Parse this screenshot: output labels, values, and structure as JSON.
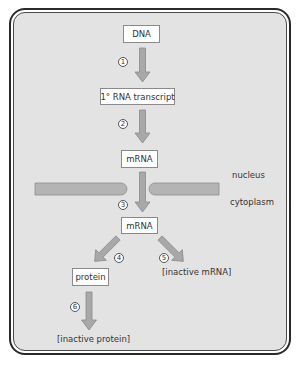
{
  "diagram": {
    "title": "",
    "nodes": {
      "dna": "DNA",
      "primary_transcript": "1° RNA transcript",
      "mrna_nucleus": "mRNA",
      "mrna_cytoplasm": "mRNA",
      "protein": "protein",
      "inactive_mrna": "[inactive mRNA]",
      "inactive_protein": "[inactive protein]"
    },
    "compartments": {
      "nucleus": "nucleus",
      "cytoplasm": "cytoplasm"
    },
    "steps": [
      "1",
      "2",
      "3",
      "4",
      "5",
      "6"
    ],
    "edges": [
      {
        "from": "DNA",
        "to": "1° RNA transcript",
        "step": "1"
      },
      {
        "from": "1° RNA transcript",
        "to": "mRNA",
        "step": "2"
      },
      {
        "from": "mRNA",
        "to": "mRNA (cytoplasm)",
        "step": "3"
      },
      {
        "from": "mRNA (cytoplasm)",
        "to": "protein",
        "step": "4"
      },
      {
        "from": "mRNA (cytoplasm)",
        "to": "[inactive mRNA]",
        "step": "5"
      },
      {
        "from": "protein",
        "to": "[inactive protein]",
        "step": "6"
      }
    ],
    "colors": {
      "panel_background": "#e3e3e3",
      "arrow_fill": "#a8a8a8",
      "arrow_stroke": "#8a8a8a",
      "border": "#2a2a2a"
    }
  }
}
